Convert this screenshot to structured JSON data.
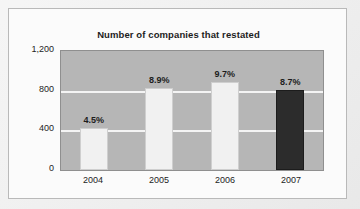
{
  "card": {
    "title": "Number of companies that restated"
  },
  "chart_data": {
    "type": "bar",
    "title": "Number of companies that restated",
    "xlabel": "",
    "ylabel": "",
    "categories": [
      "2004",
      "2005",
      "2006",
      "2007"
    ],
    "values": [
      420,
      830,
      890,
      810
    ],
    "point_labels": [
      "4.5%",
      "8.9%",
      "9.7%",
      "8.7%"
    ],
    "ylim": [
      0,
      1200
    ],
    "yticks": [
      0,
      400,
      800,
      1200
    ],
    "ytick_labels": [
      "0",
      "400",
      "800",
      "1,200"
    ],
    "grid": true,
    "legend": false,
    "series": [
      {
        "name": "Number of companies that restated",
        "values": [
          420,
          830,
          890,
          810
        ]
      }
    ],
    "bar_colors": [
      "#f1f1f1",
      "#f1f1f1",
      "#f1f1f1",
      "#2c2c2c"
    ],
    "highlight_category": "2007",
    "plot_background": "#b6b6b6",
    "gridline_color": "#f4f4f4",
    "text_color": "#1d1d1d"
  },
  "axis": {
    "y_labels": [
      "1,200",
      "800",
      "400",
      "0"
    ],
    "x_labels": [
      "2004",
      "2005",
      "2006",
      "2007"
    ]
  },
  "bars": [
    {
      "category": "2004",
      "label": "4.5%",
      "value": 420,
      "color": "#f1f1f1"
    },
    {
      "category": "2005",
      "label": "8.9%",
      "value": 830,
      "color": "#f1f1f1"
    },
    {
      "category": "2006",
      "label": "9.7%",
      "value": 890,
      "color": "#f1f1f1"
    },
    {
      "category": "2007",
      "label": "8.7%",
      "value": 810,
      "color": "#2c2c2c"
    }
  ]
}
